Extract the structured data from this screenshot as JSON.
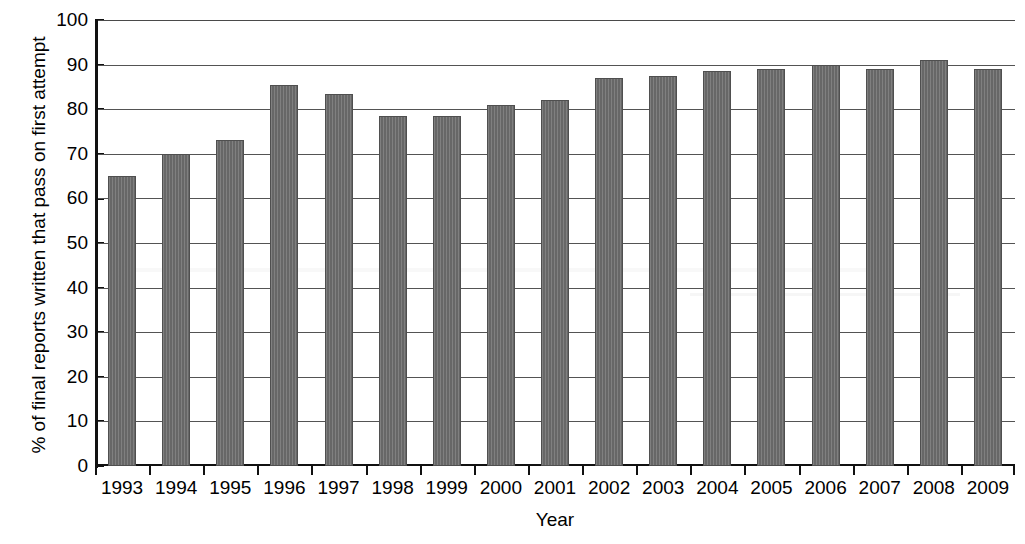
{
  "chart_data": {
    "type": "bar",
    "title": "",
    "xlabel": "Year",
    "ylabel": "% of final reports written that pass on first attempt",
    "categories": [
      "1993",
      "1994",
      "1995",
      "1996",
      "1997",
      "1998",
      "1999",
      "2000",
      "2001",
      "2002",
      "2003",
      "2004",
      "2005",
      "2006",
      "2007",
      "2008",
      "2009"
    ],
    "values": [
      65,
      70,
      73,
      85.5,
      83.5,
      78.5,
      78.5,
      81,
      82,
      87,
      87.5,
      88.5,
      89,
      90,
      89,
      91,
      89
    ],
    "series": [
      {
        "name": "% of final reports written that pass on first attempt",
        "values": [
          65,
          70,
          73,
          85.5,
          83.5,
          78.5,
          78.5,
          81,
          82,
          87,
          87.5,
          88.5,
          89,
          90,
          89,
          91,
          89
        ]
      }
    ],
    "ylim": [
      0,
      100
    ],
    "ytick_step": 10,
    "yticks": [
      0,
      10,
      20,
      30,
      40,
      50,
      60,
      70,
      80,
      90,
      100
    ],
    "ytick_labels": [
      "0",
      "10",
      "20",
      "30",
      "40",
      "50",
      "60",
      "70",
      "80",
      "90",
      "100"
    ],
    "grid": true,
    "grid_axis": "y",
    "legend": false,
    "legend_position": "none",
    "bar_color": "#6d6d6d",
    "bar_edge_color": "#4f4f4f",
    "grid_color": "#545454",
    "axis_color": "#111111",
    "background_color": "#ffffff"
  }
}
